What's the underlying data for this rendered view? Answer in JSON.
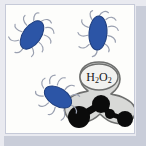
{
  "figure": {
    "name": "bacteria-and-hydrogen-peroxide-illustration",
    "background_color": "#e9eaf0",
    "panel_color": "#fdfdfb",
    "panel_border_color": "#c6cad8",
    "shadow_color": "#c9cdd9"
  },
  "molecule": {
    "formula_text": "H2O2",
    "formula_parts": {
      "h": "H",
      "sub1": "2",
      "o": "O",
      "sub2": "2"
    },
    "blob_fill": "#d8d9d7",
    "blob_stroke": "#6e6f6e",
    "bubble_fill": "#f2f2f0",
    "bubble_stroke": "#6e6f6e",
    "atom_color": "#0b0b0b",
    "atoms": [
      {
        "label": "oxygen-left",
        "cx": 79,
        "cy": 117,
        "r": 11
      },
      {
        "label": "oxygen-right",
        "cx": 125,
        "cy": 119,
        "r": 8
      },
      {
        "label": "hydrogen-top",
        "cx": 101,
        "cy": 104,
        "r": 9
      },
      {
        "label": "hydrogen-mid",
        "cx": 110,
        "cy": 114,
        "r": 5
      }
    ]
  },
  "bacteria": {
    "body_color": "#2c55a6",
    "body_stroke": "#1e3d7d",
    "pili_color": "#9aa0b0",
    "cells": [
      {
        "label": "bacterium-top-left",
        "cx": 32,
        "cy": 35,
        "rx": 9,
        "ry": 16,
        "angle": 35
      },
      {
        "label": "bacterium-top-right",
        "cx": 98,
        "cy": 33,
        "rx": 9,
        "ry": 17,
        "angle": 4
      },
      {
        "label": "bacterium-bottom-left",
        "cx": 58,
        "cy": 97,
        "rx": 9,
        "ry": 15,
        "angle": -58
      }
    ]
  }
}
